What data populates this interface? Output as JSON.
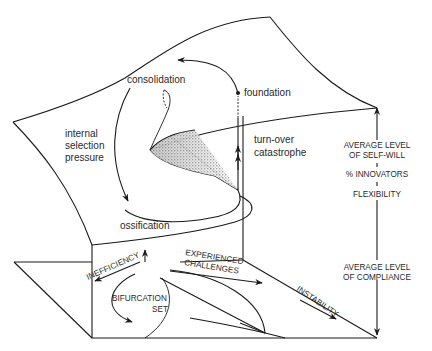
{
  "figure": {
    "type": "cusp-catastrophe-surface",
    "colors": {
      "line": "#1a1a1a",
      "text": "#2a2a2a",
      "background": "#ffffff",
      "shading": "#555555"
    }
  },
  "surface_labels": {
    "consolidation": "consolidation",
    "foundation": "foundation",
    "internal_selection_pressure": [
      "internal",
      "selection",
      "pressure"
    ],
    "turn_over_catastrophe": [
      "turn-over",
      "catastrophe"
    ],
    "ossification": "ossification"
  },
  "axis": {
    "top": [
      "AVERAGE LEVEL",
      "OF SELF-WILL"
    ],
    "middle_1": "% INNOVATORS",
    "middle_2": "FLEXIBILITY",
    "bottom": [
      "AVERAGE LEVEL",
      "OF COMPLIANCE"
    ]
  },
  "control_plane": {
    "inefficiency": "INEFFICIENCY",
    "experienced_challenges": [
      "EXPERIENCED",
      "CHALLENGES"
    ],
    "bifurcation_set": [
      "BIFURCATION",
      "SET"
    ],
    "instability": "INSTABILITY"
  }
}
